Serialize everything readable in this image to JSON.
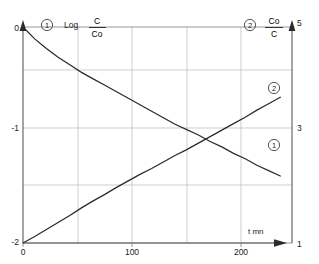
{
  "chart_data": {
    "type": "line",
    "title": "",
    "subtitle": "",
    "xlabel": "t  mn",
    "xlim": [
      0,
      230
    ],
    "x_ticks": [
      0,
      50,
      100,
      150,
      200
    ],
    "x_tick_labels": [
      "0",
      "",
      "100",
      "",
      "200"
    ],
    "grid": true,
    "legend_position": "inline-annotations",
    "left_axis": {
      "label_prefix": "Log",
      "label_numerator": "C",
      "label_denominator": "Co",
      "ylim": [
        -2,
        0
      ],
      "ticks": [
        0,
        -1,
        -2
      ],
      "tick_labels": [
        "0",
        "-1",
        "-2"
      ]
    },
    "right_axis": {
      "label_numerator": "Co",
      "label_denominator": "C",
      "ylim": [
        1,
        5
      ],
      "ticks": [
        5,
        3,
        1
      ],
      "tick_labels": [
        "5",
        "3",
        "1"
      ]
    },
    "series": [
      {
        "name": "Log C/Co",
        "tag": "1",
        "axis": "left",
        "x": [
          0,
          10,
          20,
          30,
          40,
          50,
          60,
          70,
          80,
          90,
          100,
          110,
          120,
          130,
          140,
          150,
          160,
          170,
          180,
          190,
          200,
          210,
          220
        ],
        "values": [
          0.0,
          -0.11,
          -0.2,
          -0.28,
          -0.35,
          -0.42,
          -0.48,
          -0.54,
          -0.6,
          -0.66,
          -0.72,
          -0.78,
          -0.84,
          -0.9,
          -0.95,
          -1.0,
          -1.06,
          -1.11,
          -1.17,
          -1.22,
          -1.28,
          -1.33,
          -1.38
        ]
      },
      {
        "name": "Co/C",
        "tag": "2",
        "axis": "right",
        "x": [
          0,
          10,
          20,
          30,
          40,
          50,
          60,
          70,
          80,
          90,
          100,
          110,
          120,
          130,
          140,
          150,
          160,
          170,
          180,
          190,
          200,
          210,
          220
        ],
        "values": [
          1.0,
          1.12,
          1.25,
          1.38,
          1.51,
          1.65,
          1.78,
          1.9,
          2.03,
          2.15,
          2.27,
          2.38,
          2.5,
          2.62,
          2.73,
          2.85,
          2.97,
          3.09,
          3.21,
          3.33,
          3.46,
          3.58,
          3.7
        ]
      }
    ],
    "annotations": [
      {
        "name": "series-1-header-tag",
        "text": "1"
      },
      {
        "name": "series-2-header-tag",
        "text": "2"
      },
      {
        "name": "series-1-inline-tag",
        "text": "1"
      },
      {
        "name": "series-2-inline-tag",
        "text": "2"
      }
    ],
    "colors": {
      "curve": "#2b2b2b",
      "grid": "#b9b9b9",
      "frame": "#7d7d7d",
      "axis": "#5a5a5a",
      "background": "#ffffff"
    }
  },
  "labels": {
    "left_log": "Log",
    "left_num": "C",
    "left_den": "Co",
    "right_num": "Co",
    "right_den": "C",
    "x_axis_title": "t  mn",
    "tag_one": "1",
    "tag_two": "2",
    "y_left_0": "0",
    "y_left_minus1": "-1",
    "y_left_minus2": "-2",
    "y_right_5": "5",
    "y_right_3": "3",
    "y_right_1": "1",
    "x_0": "0",
    "x_100": "100",
    "x_200": "200"
  }
}
